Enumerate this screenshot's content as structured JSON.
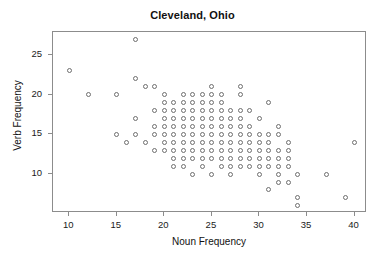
{
  "chart_data": {
    "type": "scatter",
    "title": "Cleveland, Ohio",
    "xlabel": "Noun Frequency",
    "ylabel": "Verb Frequency",
    "xlim": [
      8.3,
      41.3
    ],
    "ylim": [
      5.1,
      27.9
    ],
    "xticks": [
      10,
      15,
      20,
      25,
      30,
      35,
      40
    ],
    "xtick_labels": [
      "10",
      "15",
      "20",
      "25",
      "30",
      "35",
      "40"
    ],
    "yticks": [
      10,
      15,
      20,
      25
    ],
    "ytick_labels": [
      "10",
      "15",
      "20",
      "25"
    ],
    "grid": false,
    "legend": null,
    "marker": "open-circle",
    "marker_color": "#6e6e6e",
    "frame_color": "#8c8c8c",
    "points": [
      [
        10,
        23
      ],
      [
        12,
        20
      ],
      [
        15,
        20
      ],
      [
        15,
        15
      ],
      [
        16,
        14
      ],
      [
        17,
        27
      ],
      [
        17,
        22
      ],
      [
        17,
        17
      ],
      [
        17,
        15
      ],
      [
        18,
        21
      ],
      [
        18,
        14
      ],
      [
        19,
        21
      ],
      [
        19,
        18
      ],
      [
        19,
        16
      ],
      [
        19,
        15
      ],
      [
        19,
        13
      ],
      [
        20,
        20
      ],
      [
        20,
        19
      ],
      [
        20,
        18
      ],
      [
        20,
        17
      ],
      [
        20,
        16
      ],
      [
        20,
        15
      ],
      [
        20,
        14
      ],
      [
        20,
        13
      ],
      [
        21,
        19
      ],
      [
        21,
        18
      ],
      [
        21,
        17
      ],
      [
        21,
        16
      ],
      [
        21,
        15
      ],
      [
        21,
        14
      ],
      [
        21,
        13
      ],
      [
        21,
        12
      ],
      [
        21,
        11
      ],
      [
        22,
        20
      ],
      [
        22,
        19
      ],
      [
        22,
        18
      ],
      [
        22,
        17
      ],
      [
        22,
        16
      ],
      [
        22,
        15
      ],
      [
        22,
        14
      ],
      [
        22,
        13
      ],
      [
        22,
        12
      ],
      [
        22,
        11
      ],
      [
        23,
        20
      ],
      [
        23,
        19
      ],
      [
        23,
        18
      ],
      [
        23,
        17
      ],
      [
        23,
        16
      ],
      [
        23,
        15
      ],
      [
        23,
        14
      ],
      [
        23,
        13
      ],
      [
        23,
        12
      ],
      [
        23,
        10
      ],
      [
        24,
        20
      ],
      [
        24,
        19
      ],
      [
        24,
        18
      ],
      [
        24,
        17
      ],
      [
        24,
        16
      ],
      [
        24,
        15
      ],
      [
        24,
        14
      ],
      [
        24,
        13
      ],
      [
        24,
        12
      ],
      [
        24,
        11
      ],
      [
        25,
        21
      ],
      [
        25,
        20
      ],
      [
        25,
        19
      ],
      [
        25,
        18
      ],
      [
        25,
        17
      ],
      [
        25,
        16
      ],
      [
        25,
        15
      ],
      [
        25,
        14
      ],
      [
        25,
        13
      ],
      [
        25,
        12
      ],
      [
        25,
        10
      ],
      [
        26,
        20
      ],
      [
        26,
        19
      ],
      [
        26,
        18
      ],
      [
        26,
        17
      ],
      [
        26,
        16
      ],
      [
        26,
        15
      ],
      [
        26,
        14
      ],
      [
        26,
        13
      ],
      [
        26,
        12
      ],
      [
        26,
        11
      ],
      [
        27,
        18
      ],
      [
        27,
        17
      ],
      [
        27,
        16
      ],
      [
        27,
        15
      ],
      [
        27,
        14
      ],
      [
        27,
        13
      ],
      [
        27,
        12
      ],
      [
        27,
        11
      ],
      [
        27,
        10
      ],
      [
        28,
        21
      ],
      [
        28,
        20
      ],
      [
        28,
        18
      ],
      [
        28,
        17
      ],
      [
        28,
        16
      ],
      [
        28,
        15
      ],
      [
        28,
        14
      ],
      [
        28,
        13
      ],
      [
        28,
        12
      ],
      [
        28,
        11
      ],
      [
        29,
        18
      ],
      [
        29,
        16
      ],
      [
        29,
        15
      ],
      [
        29,
        14
      ],
      [
        29,
        13
      ],
      [
        29,
        12
      ],
      [
        29,
        11
      ],
      [
        30,
        17
      ],
      [
        30,
        15
      ],
      [
        30,
        14
      ],
      [
        30,
        13
      ],
      [
        30,
        12
      ],
      [
        30,
        11
      ],
      [
        30,
        10
      ],
      [
        31,
        19
      ],
      [
        31,
        15
      ],
      [
        31,
        14
      ],
      [
        31,
        13
      ],
      [
        31,
        12
      ],
      [
        31,
        11
      ],
      [
        31,
        8
      ],
      [
        32,
        16
      ],
      [
        32,
        15
      ],
      [
        32,
        13
      ],
      [
        32,
        12
      ],
      [
        32,
        11
      ],
      [
        32,
        10
      ],
      [
        32,
        9
      ],
      [
        33,
        14
      ],
      [
        33,
        13
      ],
      [
        33,
        12
      ],
      [
        33,
        11
      ],
      [
        33,
        9
      ],
      [
        34,
        10
      ],
      [
        34,
        7
      ],
      [
        34,
        6
      ],
      [
        37,
        10
      ],
      [
        39,
        7
      ],
      [
        40,
        14
      ]
    ]
  }
}
